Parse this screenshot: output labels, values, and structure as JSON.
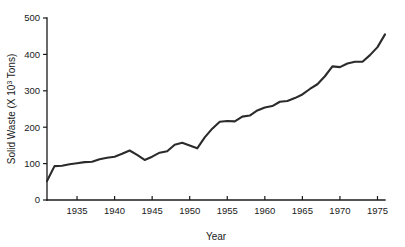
{
  "chart_data": {
    "type": "line",
    "title": "",
    "xlabel": "Year",
    "ylabel": "Solid Waste (X 10³ Tons)",
    "ylabel_prefix": "Solid Waste (X 10",
    "ylabel_exponent": "3",
    "ylabel_suffix": " Tons)",
    "xlim": [
      1931,
      1976
    ],
    "ylim": [
      0,
      500
    ],
    "grid": false,
    "legend": null,
    "x_ticks": [
      1935,
      1940,
      1945,
      1950,
      1955,
      1960,
      1965,
      1970,
      1975
    ],
    "x_tick_labels": [
      "1935",
      "1940",
      "1945",
      "1950",
      "1955",
      "1960",
      "1965",
      "1970",
      "1975"
    ],
    "y_ticks": [
      0,
      100,
      200,
      300,
      400,
      500
    ],
    "y_tick_labels": [
      "0",
      "100",
      "200",
      "300",
      "400",
      "500"
    ],
    "series": [
      {
        "name": "Solid Waste",
        "color": "#2b2b2b",
        "x": [
          1931,
          1932,
          1933,
          1934,
          1935,
          1936,
          1937,
          1938,
          1939,
          1940,
          1941,
          1942,
          1943,
          1944,
          1945,
          1946,
          1947,
          1948,
          1949,
          1950,
          1951,
          1952,
          1953,
          1954,
          1955,
          1956,
          1957,
          1958,
          1959,
          1960,
          1961,
          1962,
          1963,
          1964,
          1965,
          1966,
          1967,
          1968,
          1969,
          1970,
          1971,
          1972,
          1973,
          1974,
          1975,
          1976
        ],
        "values": [
          52,
          93,
          94,
          98,
          101,
          104,
          105,
          112,
          116,
          119,
          127,
          136,
          124,
          110,
          119,
          130,
          134,
          152,
          157,
          150,
          142,
          172,
          196,
          215,
          217,
          216,
          229,
          232,
          246,
          254,
          258,
          270,
          272,
          280,
          290,
          305,
          318,
          340,
          367,
          365,
          375,
          380,
          380,
          398,
          420,
          455
        ]
      }
    ]
  },
  "figure": {
    "plot_left": 47,
    "plot_right": 385,
    "plot_top": 18,
    "plot_bottom": 200
  }
}
